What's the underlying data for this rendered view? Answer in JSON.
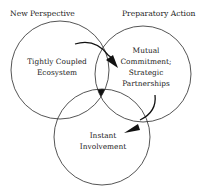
{
  "diagram": {
    "type": "venn",
    "headers": {
      "left": "New Perspective",
      "right": "Preparatory Action"
    },
    "circles": {
      "left": {
        "line1": "Tightly Coupled",
        "line2": "Ecosystem"
      },
      "right": {
        "line1": "Mutual",
        "line2": "Commitment;",
        "line3": "Strategic",
        "line4": "Partnerships"
      },
      "bottom": {
        "line1": "Instant",
        "line2": "Involvement"
      }
    },
    "arrows": [
      {
        "from": "left",
        "to": "right",
        "label": ""
      },
      {
        "from": "right",
        "to": "bottom",
        "label": ""
      }
    ],
    "colors": {
      "stroke": "#2a2a2a",
      "text": "#1a1a1a",
      "fill": "#111111"
    }
  }
}
